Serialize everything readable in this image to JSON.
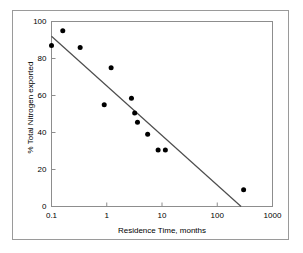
{
  "figure": {
    "background_color": "#ffffff",
    "outer_border_color": "#9a9a9a",
    "plot_frame_color": "#8d8d8d"
  },
  "chart_data": {
    "type": "scatter",
    "title": "",
    "xlabel": "Residence Time, months",
    "ylabel": "% Total Nitrogen exported",
    "xscale": "log",
    "yscale": "linear",
    "xlim": [
      0.1,
      1000
    ],
    "ylim": [
      0,
      100
    ],
    "xticks": [
      0.1,
      1,
      10,
      100,
      1000
    ],
    "xticklabels": [
      "0.1",
      "1",
      "10",
      "100",
      "1000"
    ],
    "yticks": [
      0,
      20,
      40,
      60,
      80,
      100
    ],
    "yticklabels": [
      "0",
      "20",
      "40",
      "60",
      "80",
      "100"
    ],
    "grid": false,
    "legend": null,
    "marker": {
      "shape": "circle",
      "color": "#000000",
      "size_px": 5
    },
    "series": [
      {
        "name": "Observations",
        "type": "scatter",
        "points": [
          {
            "x": 0.1,
            "y": 87.0
          },
          {
            "x": 0.16,
            "y": 95.0
          },
          {
            "x": 0.33,
            "y": 86.0
          },
          {
            "x": 0.9,
            "y": 55.0
          },
          {
            "x": 1.2,
            "y": 75.0
          },
          {
            "x": 2.8,
            "y": 58.5
          },
          {
            "x": 3.2,
            "y": 50.5
          },
          {
            "x": 3.6,
            "y": 45.5
          },
          {
            "x": 5.5,
            "y": 39.0
          },
          {
            "x": 8.5,
            "y": 30.5
          },
          {
            "x": 11.5,
            "y": 30.5
          },
          {
            "x": 300.0,
            "y": 9.0
          }
        ]
      },
      {
        "name": "Regression line",
        "type": "line",
        "color": "#4d4d4d",
        "endpoints": [
          {
            "x": 0.1,
            "y": 92.0
          },
          {
            "x": 270.0,
            "y": 0.0
          }
        ]
      }
    ]
  }
}
